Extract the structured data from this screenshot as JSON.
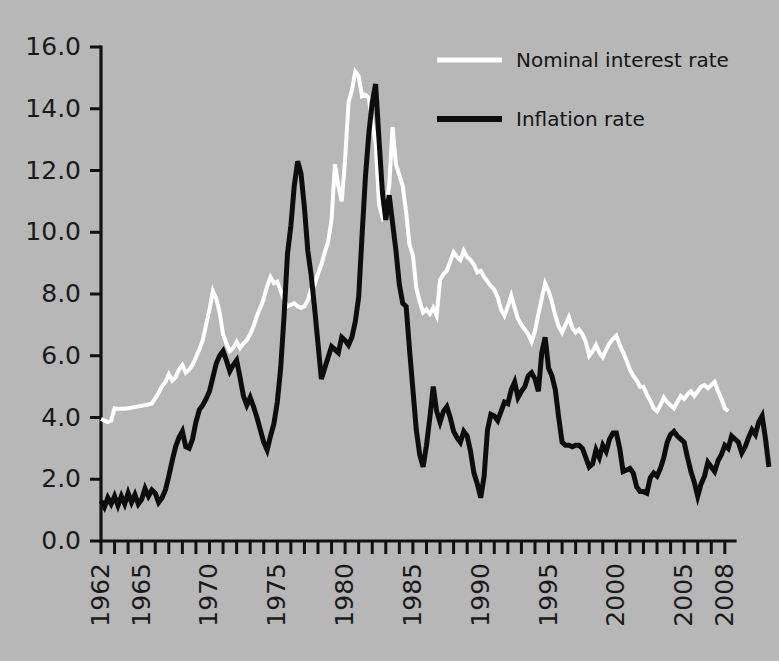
{
  "chart_data": {
    "type": "line",
    "title": "",
    "subtitle": "",
    "xlabel": "",
    "ylabel": "",
    "xlim": [
      1962,
      2008.75
    ],
    "ylim": [
      0.0,
      16.0
    ],
    "grid": false,
    "legend_position": "top-right",
    "background_color": "#b7b7b7",
    "y_ticks": [
      "0.0",
      "2.0",
      "4.0",
      "6.0",
      "8.0",
      "10.0",
      "12.0",
      "14.0",
      "16.0"
    ],
    "y_tick_values": [
      0.0,
      2.0,
      4.0,
      6.0,
      8.0,
      10.0,
      12.0,
      14.0,
      16.0
    ],
    "x_tick_labels": [
      "1962",
      "1965",
      "1970",
      "1975",
      "1980",
      "1985",
      "1990",
      "1995",
      "2000",
      "2005",
      "2008"
    ],
    "x_tick_label_values": [
      1962,
      1965,
      1970,
      1975,
      1980,
      1985,
      1990,
      1995,
      2000,
      2005,
      2008
    ],
    "x_minor_tick_values": [
      1962,
      1963,
      1964,
      1965,
      1966,
      1967,
      1968,
      1969,
      1970,
      1971,
      1972,
      1973,
      1974,
      1975,
      1976,
      1977,
      1978,
      1979,
      1980,
      1981,
      1982,
      1983,
      1984,
      1985,
      1986,
      1987,
      1988,
      1989,
      1990,
      1991,
      1992,
      1993,
      1994,
      1995,
      1996,
      1997,
      1998,
      1999,
      2000,
      2001,
      2002,
      2003,
      2004,
      2005,
      2006,
      2007,
      2008
    ],
    "x_frequency": "quarterly",
    "x_start": 1962.0,
    "x_step": 0.25,
    "series": [
      {
        "name": "Nominal interest rate",
        "color": "#ffffff",
        "line_width": 4.0,
        "values": [
          3.95,
          3.9,
          3.85,
          3.9,
          4.3,
          4.28,
          4.28,
          4.28,
          4.3,
          4.32,
          4.34,
          4.36,
          4.38,
          4.4,
          4.42,
          4.45,
          4.62,
          4.8,
          5.02,
          5.15,
          5.4,
          5.2,
          5.3,
          5.55,
          5.7,
          5.45,
          5.55,
          5.7,
          5.95,
          6.2,
          6.5,
          7.0,
          7.5,
          8.1,
          7.85,
          7.4,
          6.7,
          6.4,
          6.15,
          6.25,
          6.45,
          6.25,
          6.4,
          6.5,
          6.7,
          6.95,
          7.3,
          7.55,
          7.85,
          8.25,
          8.55,
          8.35,
          8.4,
          8.1,
          7.8,
          7.6,
          7.65,
          7.7,
          7.6,
          7.55,
          7.6,
          7.8,
          8.15,
          8.3,
          8.65,
          8.95,
          9.35,
          9.7,
          10.4,
          12.2,
          11.5,
          11.0,
          12.35,
          14.2,
          14.6,
          15.2,
          15.05,
          14.4,
          14.45,
          14.35,
          13.55,
          12.9,
          10.9,
          10.5,
          10.75,
          11.5,
          13.4,
          12.2,
          11.85,
          11.5,
          10.65,
          9.6,
          9.25,
          8.2,
          7.75,
          7.4,
          7.5,
          7.35,
          7.55,
          7.3,
          8.45,
          8.65,
          8.75,
          9.05,
          9.35,
          9.2,
          9.1,
          9.4,
          9.2,
          9.1,
          8.95,
          8.7,
          8.75,
          8.55,
          8.4,
          8.25,
          8.15,
          7.9,
          7.5,
          7.3,
          7.6,
          7.95,
          7.55,
          7.2,
          7.0,
          6.85,
          6.7,
          6.45,
          6.8,
          7.35,
          7.85,
          8.35,
          8.1,
          7.75,
          7.3,
          6.95,
          6.75,
          7.0,
          7.25,
          6.9,
          6.75,
          6.85,
          6.7,
          6.45,
          6.0,
          6.15,
          6.35,
          6.1,
          5.95,
          6.2,
          6.4,
          6.55,
          6.65,
          6.35,
          6.1,
          5.85,
          5.55,
          5.35,
          5.2,
          5.0,
          5.0,
          4.75,
          4.55,
          4.3,
          4.2,
          4.4,
          4.65,
          4.5,
          4.4,
          4.3,
          4.5,
          4.7,
          4.6,
          4.75,
          4.85,
          4.7,
          4.85,
          5.0,
          5.05,
          4.95,
          5.05,
          5.15,
          4.85,
          4.6,
          4.3,
          4.2
        ]
      },
      {
        "name": "Inflation rate",
        "color": "#0d0d0d",
        "line_width": 5.0,
        "values": [
          1.3,
          1.1,
          1.4,
          1.2,
          1.45,
          1.15,
          1.45,
          1.2,
          1.55,
          1.25,
          1.5,
          1.2,
          1.35,
          1.7,
          1.45,
          1.65,
          1.55,
          1.25,
          1.4,
          1.65,
          2.1,
          2.6,
          3.05,
          3.35,
          3.55,
          3.05,
          3.0,
          3.3,
          3.85,
          4.25,
          4.4,
          4.6,
          4.85,
          5.3,
          5.75,
          6.0,
          6.15,
          5.85,
          5.5,
          5.7,
          5.85,
          5.3,
          4.7,
          4.4,
          4.65,
          4.35,
          4.0,
          3.6,
          3.2,
          2.95,
          3.4,
          3.8,
          4.5,
          5.6,
          7.3,
          9.3,
          10.2,
          11.5,
          12.3,
          11.9,
          10.8,
          9.4,
          8.6,
          7.55,
          6.4,
          5.25,
          5.6,
          5.95,
          6.3,
          6.2,
          6.1,
          6.6,
          6.5,
          6.35,
          6.6,
          7.1,
          7.9,
          9.9,
          11.8,
          13.2,
          14.2,
          14.8,
          13.0,
          11.3,
          10.4,
          11.2,
          10.3,
          9.4,
          8.3,
          7.7,
          7.6,
          6.2,
          4.9,
          3.6,
          2.8,
          2.4,
          3.1,
          4.0,
          5.0,
          4.2,
          3.85,
          4.2,
          4.35,
          4.0,
          3.55,
          3.35,
          3.2,
          3.55,
          3.4,
          2.9,
          2.2,
          1.85,
          1.4,
          2.1,
          3.6,
          4.1,
          4.05,
          3.9,
          4.2,
          4.5,
          4.45,
          4.9,
          5.15,
          4.65,
          4.85,
          5.0,
          5.35,
          5.45,
          5.25,
          4.85,
          6.1,
          6.6,
          5.6,
          5.35,
          4.9,
          4.0,
          3.2,
          3.1,
          3.1,
          3.05,
          3.1,
          3.1,
          3.0,
          2.7,
          2.4,
          2.5,
          2.95,
          2.7,
          3.1,
          2.9,
          3.3,
          3.5,
          3.5,
          3.0,
          2.25,
          2.3,
          2.35,
          2.2,
          1.75,
          1.6,
          1.6,
          1.55,
          2.05,
          2.2,
          2.1,
          2.35,
          2.7,
          3.2,
          3.45,
          3.55,
          3.4,
          3.3,
          3.2,
          2.7,
          2.25,
          1.9,
          1.45,
          1.85,
          2.1,
          2.55,
          2.4,
          2.25,
          2.6,
          2.8,
          3.1,
          3.0,
          3.4,
          3.3,
          3.2,
          2.85,
          3.05,
          3.35,
          3.6,
          3.45,
          3.85,
          4.05,
          3.3,
          2.4
        ]
      }
    ]
  },
  "legend": {
    "entries": [
      {
        "label": "Nominal interest rate",
        "swatch": "white-line-swatch"
      },
      {
        "label": "Inflation rate",
        "swatch": "black-line-swatch"
      }
    ]
  }
}
